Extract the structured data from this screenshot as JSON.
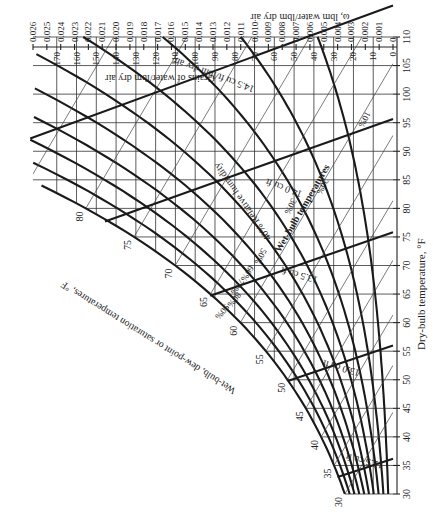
{
  "chart_data": {
    "type": "psychrometric",
    "title": "",
    "orientation": "rotated 90 degrees (dry-bulb axis vertical at right, humidity-ratio axis horizontal at top)",
    "xlabel": "Dry-bulb temperature, °F",
    "ylabel": "ω, lbm water/lbm dry air",
    "secondary_ylabel": "Grains of water/lbm dry air",
    "curve_label": "Wet-bulb, dew-point or saturation temperatures, °F",
    "dry_bulb_ticks": [
      30,
      35,
      40,
      45,
      50,
      55,
      60,
      65,
      70,
      75,
      80,
      85,
      90,
      95,
      100,
      105,
      110
    ],
    "dry_bulb_range": [
      30,
      110
    ],
    "humidity_ratio_ticks": [
      "0",
      "0.001",
      "0.002",
      "0.003",
      "0.004",
      "0.005",
      "0.006",
      "0.007",
      "0.008",
      "0.009",
      "0.010",
      "0.011",
      "0.012",
      "0.013",
      "0.014",
      "0.015",
      "0.016",
      "0.017",
      "0.018",
      "0.019",
      "0.020",
      "0.021",
      "0.022",
      "0.023",
      "0.024",
      "0.025",
      "0.026"
    ],
    "humidity_ratio_range": [
      0,
      0.026
    ],
    "grains_ticks": [
      0,
      10,
      20,
      30,
      40,
      50,
      60,
      70,
      80,
      90,
      100,
      110,
      120,
      130,
      140,
      150,
      160,
      170
    ],
    "saturation_temperature_labels": [
      30,
      35,
      40,
      45,
      50,
      55,
      60,
      65,
      70,
      75,
      80,
      85,
      90
    ],
    "relative_humidity_curves": [
      "10%",
      "20%",
      "30%",
      "40%",
      "50%",
      "60%",
      "70%",
      "80%",
      "90%",
      "100%"
    ],
    "relative_humidity_label": "Relative humidity",
    "wet_bulb_label": "Wet-bulb temperatures",
    "specific_volume_lines": [
      {
        "label": "12.5 cu ft",
        "value": 12.5
      },
      {
        "label": "13.0 cu ft",
        "value": 13.0
      },
      {
        "label": "13.5 cu ft",
        "value": 13.5
      },
      {
        "label": "14.0 cu ft",
        "value": 14.0
      },
      {
        "label": "14.5 cu ft/lbm dry air",
        "value": 14.5
      }
    ],
    "grid": true,
    "legend": "none"
  },
  "labels": {
    "x_axis_title": "Dry-bulb temperature, °F",
    "y_axis_title": "ω, lbm water/lbm dry air",
    "grains_title": "Grains of water/lbm dry air",
    "saturation_title": "Wet-bulb, dew-point or saturation temperatures, °F",
    "rh_title": "40% Relative humidity",
    "wb_title": "Wet-bulb temperatures",
    "v145": "14.5 cu ft/lbm dry air",
    "v140": "14.0 cu ft",
    "v135": "13.5 cu ft",
    "v130": "13.0 cu ft",
    "v125": "12.5 cu ft",
    "rh10": "10%",
    "rh20": "20%",
    "rh30": "30%",
    "rh50": "50%",
    "rh60": "60%",
    "rh70": "70%",
    "rh80": "80%",
    "rh90": "90%"
  }
}
